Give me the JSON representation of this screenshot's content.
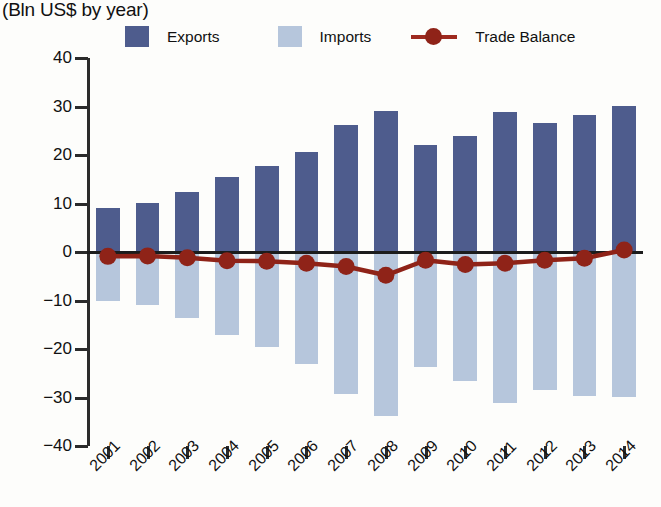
{
  "subtitle": "(Bln US$ by year)",
  "title_fragment": "",
  "legend": {
    "exports": "Exports",
    "imports": "Imports",
    "balance": "Trade Balance"
  },
  "colors": {
    "exports": "#4e5c8d",
    "imports": "#b6c6dc",
    "balance": "#8f2318",
    "axis": "#2b2b2b",
    "background": "#fdfdfb"
  },
  "chart_data": {
    "type": "bar",
    "title": "",
    "subtitle": "(Bln US$ by year)",
    "xlabel": "",
    "ylabel": "(Bln US$ by year)",
    "ylim": [
      -40,
      40
    ],
    "yticks": [
      40,
      30,
      20,
      10,
      0,
      -10,
      -20,
      -30,
      -40
    ],
    "ytick_labels": [
      "40",
      "30",
      "20",
      "10",
      "0",
      "−10",
      "−20",
      "−30",
      "−40"
    ],
    "grid": false,
    "legend_position": "top",
    "categories": [
      "2001",
      "2002",
      "2003",
      "2004",
      "2005",
      "2006",
      "2007",
      "2008",
      "2009",
      "2010",
      "2011",
      "2012",
      "2013",
      "2014"
    ],
    "series": [
      {
        "name": "Exports",
        "type": "bar",
        "color": "#4e5c8d",
        "values": [
          9.1,
          10.2,
          12.4,
          15.4,
          17.7,
          20.7,
          26.2,
          29.1,
          22.1,
          24.0,
          28.8,
          26.7,
          28.3,
          30.2
        ]
      },
      {
        "name": "Imports",
        "type": "bar",
        "color": "#b6c6dc",
        "values": [
          -10.0,
          -11.0,
          -13.6,
          -17.2,
          -19.6,
          -23.0,
          -29.2,
          -33.9,
          -23.8,
          -26.6,
          -31.1,
          -28.4,
          -29.6,
          -29.8
        ]
      },
      {
        "name": "Trade Balance",
        "type": "line",
        "color": "#8f2318",
        "values": [
          -0.9,
          -0.8,
          -1.2,
          -1.8,
          -1.9,
          -2.3,
          -3.0,
          -4.8,
          -1.7,
          -2.6,
          -2.3,
          -1.7,
          -1.3,
          0.4
        ]
      }
    ]
  }
}
